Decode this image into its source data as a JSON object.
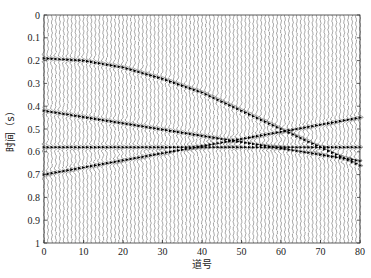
{
  "chart_data": {
    "type": "line",
    "subtype": "seismic-wiggle-section",
    "title": "",
    "xlabel": "道号",
    "ylabel": "时间（s）",
    "xlim": [
      0,
      80
    ],
    "ylim": [
      1,
      0
    ],
    "y_inverted": true,
    "grid": false,
    "legend": null,
    "x_ticks": [
      0,
      10,
      20,
      30,
      40,
      50,
      60,
      70,
      80
    ],
    "x_tick_labels": [
      "0",
      "10",
      "20",
      "30",
      "40",
      "50",
      "60",
      "70",
      "80"
    ],
    "y_ticks": [
      0,
      0.1,
      0.2,
      0.3,
      0.4,
      0.5,
      0.6,
      0.7,
      0.8,
      0.9,
      1
    ],
    "y_tick_labels": [
      "0",
      "0.1",
      "0.2",
      "0.3",
      "0.4",
      "0.5",
      "0.6",
      "0.7",
      "0.8",
      "0.9",
      "1"
    ],
    "trace_count": 81,
    "trace_color": "#555555",
    "event_color": "#000000",
    "series": [
      {
        "name": "event-hyperbolic",
        "shape": "hyperbola",
        "x": [
          0,
          10,
          20,
          30,
          40,
          50,
          60,
          70,
          80
        ],
        "values": [
          0.19,
          0.2,
          0.23,
          0.28,
          0.34,
          0.42,
          0.5,
          0.58,
          0.66
        ]
      },
      {
        "name": "event-linear-down",
        "shape": "linear",
        "x": [
          0,
          80
        ],
        "values": [
          0.42,
          0.64
        ]
      },
      {
        "name": "event-flat",
        "shape": "linear",
        "x": [
          0,
          80
        ],
        "values": [
          0.58,
          0.58
        ]
      },
      {
        "name": "event-linear-up",
        "shape": "linear",
        "x": [
          0,
          80
        ],
        "values": [
          0.7,
          0.45
        ]
      }
    ]
  },
  "layout": {
    "plot_left": 44,
    "plot_right": 360,
    "plot_top": 15,
    "plot_bottom": 243
  }
}
